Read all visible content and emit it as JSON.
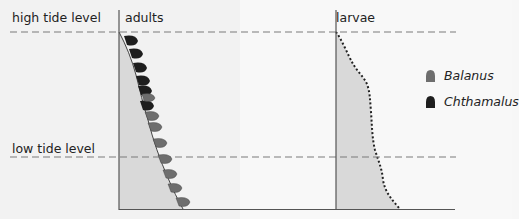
{
  "labels": {
    "high_tide": "high tide level",
    "low_tide": "low tide level",
    "adults": "adults",
    "larvae": "larvae"
  },
  "legend": [
    {
      "name": "Balanus",
      "color": "#6e6e6e"
    },
    {
      "name": "Chthamalus",
      "color": "#1e1e1e"
    }
  ],
  "colors": {
    "background": "#f7f7f7",
    "fill_area": "#d9d9d9",
    "axis": "#555555",
    "dash": "#7a7a7a",
    "balanus": "#6e6e6e",
    "chthamalus": "#1e1e1e"
  },
  "panels": [
    {
      "title": "adults",
      "content": "Chthamalus shells occupy upper shore near high tide level; Balanus shells occupy lower shore down past low tide level"
    },
    {
      "title": "larvae",
      "content": "Larvae of both species settle along entire shore from high tide level to below low tide level"
    }
  ]
}
